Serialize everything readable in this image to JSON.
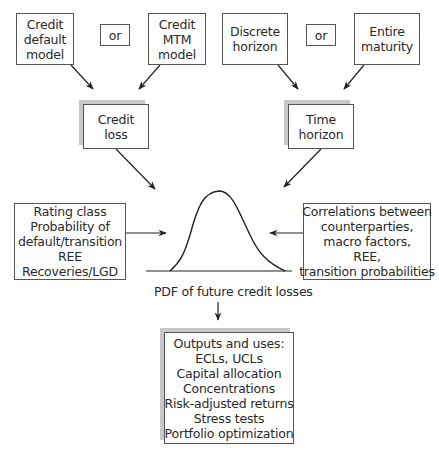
{
  "diagram": {
    "top_left": {
      "box1": [
        "Credit",
        "default",
        "model"
      ],
      "or": "or",
      "box2": [
        "Credit",
        "MTM",
        "model"
      ]
    },
    "top_right": {
      "box1": [
        "Discrete",
        "horizon"
      ],
      "or": "or",
      "box2": [
        "Entire",
        "maturity"
      ]
    },
    "credit_loss": [
      "Credit",
      "loss"
    ],
    "time_horizon": [
      "Time",
      "horizon"
    ],
    "left_inputs": [
      "Rating class",
      "Probability of",
      "default/transition",
      "REE",
      "Recoveries/LGD"
    ],
    "right_inputs": [
      "Correlations between",
      "counterparties,",
      "macro factors,",
      "REE,",
      "transition probabilities"
    ],
    "pdf_caption": "PDF of future credit losses",
    "outputs": [
      "Outputs and uses:",
      "ECLs, UCLs",
      "Capital allocation",
      "Concentrations",
      "Risk-adjusted returns",
      "Stress tests",
      "Portfolio optimization"
    ]
  }
}
